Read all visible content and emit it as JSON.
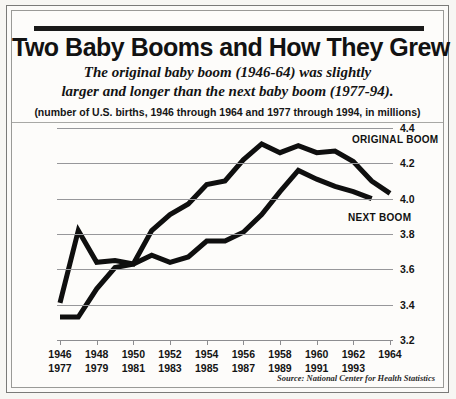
{
  "header": {
    "title": "Two Baby Booms and How They Grew",
    "subtitle_line1": "The original baby boom (1946-64) was slightly",
    "subtitle_line2": "larger and longer than the next baby boom (1977-94).",
    "units_note": "(number of U.S. births, 1946 through 1964 and 1977 through 1994, in millions)"
  },
  "source": "Source: National Center for Health Statistics",
  "colors": {
    "line": "#0f0f0f",
    "grid": "#97979a",
    "text": "#141414",
    "paper": "#fdfcfa",
    "frame": "#7a7a78"
  },
  "chart_data": {
    "type": "line",
    "title": "Two Baby Booms and How They Grew",
    "xlabel": "",
    "ylabel": "",
    "ylim": [
      3.2,
      4.4
    ],
    "yticks": [
      "3.2",
      "3.4",
      "3.6",
      "3.8",
      "4.0",
      "4.2",
      "4.4"
    ],
    "grid": true,
    "legend_position": "inline-annotation",
    "xtick_rows": [
      [
        "1946",
        "1948",
        "1950",
        "1952",
        "1954",
        "1956",
        "1958",
        "1960",
        "1962",
        "1964"
      ],
      [
        "1977",
        "1979",
        "1981",
        "1983",
        "1985",
        "1987",
        "1989",
        "1991",
        "1993",
        ""
      ]
    ],
    "x_index": [
      0,
      1,
      2,
      3,
      4,
      5,
      6,
      7,
      8,
      9,
      10,
      11,
      12,
      13,
      14,
      15,
      16,
      17,
      18
    ],
    "series": [
      {
        "name": "ORIGINAL BOOM",
        "years": [
          "1946",
          "1947",
          "1948",
          "1949",
          "1950",
          "1951",
          "1952",
          "1953",
          "1954",
          "1955",
          "1956",
          "1957",
          "1958",
          "1959",
          "1960",
          "1961",
          "1962",
          "1963",
          "1964"
        ],
        "values": [
          3.41,
          3.82,
          3.64,
          3.65,
          3.63,
          3.82,
          3.91,
          3.97,
          4.08,
          4.1,
          4.22,
          4.31,
          4.26,
          4.3,
          4.26,
          4.27,
          4.21,
          4.1,
          4.03
        ]
      },
      {
        "name": "NEXT BOOM",
        "years": [
          "1977",
          "1978",
          "1979",
          "1980",
          "1981",
          "1982",
          "1983",
          "1984",
          "1985",
          "1986",
          "1987",
          "1988",
          "1989",
          "1990",
          "1991",
          "1992",
          "1993",
          "1994",
          ""
        ],
        "values": [
          3.33,
          3.33,
          3.49,
          3.61,
          3.63,
          3.68,
          3.64,
          3.67,
          3.76,
          3.76,
          3.81,
          3.91,
          4.04,
          4.16,
          4.11,
          4.07,
          4.04,
          4.0,
          null
        ]
      }
    ]
  }
}
